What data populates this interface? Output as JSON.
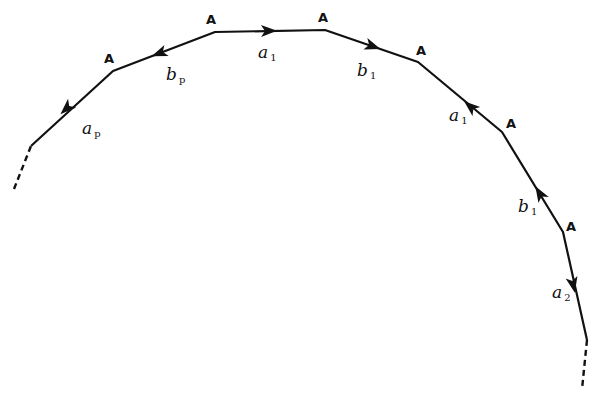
{
  "diagram": {
    "title": "",
    "stroke_color": "#111111",
    "background": "#ffffff",
    "vertex_label": "A",
    "path": {
      "dashed_start": [
        [
          14,
          189
        ],
        [
          31,
          146
        ]
      ],
      "solid_points": [
        [
          31,
          146
        ],
        [
          113,
          71
        ],
        [
          215,
          32
        ],
        [
          325,
          30
        ],
        [
          418,
          62
        ],
        [
          502,
          132
        ],
        [
          563,
          232
        ],
        [
          587,
          340
        ]
      ],
      "dashed_end": [
        [
          587,
          340
        ],
        [
          582,
          389
        ]
      ]
    },
    "vertices": [
      {
        "label": "A",
        "x": 113,
        "y": 71,
        "lx": 104,
        "ly": 63
      },
      {
        "label": "A",
        "x": 215,
        "y": 32,
        "lx": 206,
        "ly": 24
      },
      {
        "label": "A",
        "x": 325,
        "y": 30,
        "lx": 318,
        "ly": 22
      },
      {
        "label": "A",
        "x": 418,
        "y": 62,
        "lx": 416,
        "ly": 55
      },
      {
        "label": "A",
        "x": 502,
        "y": 132,
        "lx": 506,
        "ly": 128
      },
      {
        "label": "A",
        "x": 563,
        "y": 232,
        "lx": 566,
        "ly": 231
      }
    ],
    "edges": [
      {
        "name": "a",
        "sub": "p",
        "from": 0,
        "to": 1,
        "direction": "toward-start",
        "arrow": [
          67,
          108
        ],
        "angle": 137,
        "label_x": 82,
        "label_y": 134
      },
      {
        "name": "b",
        "sub": "p",
        "from": 1,
        "to": 2,
        "direction": "toward-start",
        "arrow": [
          160,
          53
        ],
        "angle": 159,
        "label_x": 166,
        "label_y": 80
      },
      {
        "name": "a",
        "sub": "1",
        "from": 2,
        "to": 3,
        "direction": "forward",
        "arrow": [
          268,
          31
        ],
        "angle": -1,
        "label_x": 258,
        "label_y": 58
      },
      {
        "name": "b",
        "sub": "1",
        "from": 3,
        "to": 4,
        "direction": "forward",
        "arrow": [
          372,
          46
        ],
        "angle": 19,
        "label_x": 357,
        "label_y": 76
      },
      {
        "name": "a",
        "sub": "1",
        "from": 4,
        "to": 5,
        "direction": "backward",
        "arrow": [
          471,
          107
        ],
        "angle": 220,
        "label_x": 449,
        "label_y": 121
      },
      {
        "name": "b",
        "sub": "1",
        "from": 5,
        "to": 6,
        "direction": "backward",
        "arrow": [
          540,
          194
        ],
        "angle": 239,
        "label_x": 518,
        "label_y": 212
      },
      {
        "name": "a",
        "sub": "2",
        "from": 6,
        "to": 7,
        "direction": "forward",
        "arrow": [
          573,
          284
        ],
        "angle": 78,
        "label_x": 552,
        "label_y": 298
      }
    ]
  }
}
